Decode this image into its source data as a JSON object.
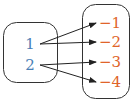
{
  "diagram": {
    "type": "mapping",
    "domain": {
      "values": [
        "1",
        "2"
      ],
      "color": "#4a7fb5"
    },
    "range": {
      "values": [
        "−1",
        "−2",
        "−3",
        "−4"
      ],
      "color": "#e0642a"
    },
    "mappings": [
      {
        "from": 0,
        "to": 0
      },
      {
        "from": 0,
        "to": 1
      },
      {
        "from": 1,
        "to": 2
      },
      {
        "from": 1,
        "to": 3
      }
    ],
    "arrow_color": "#222222",
    "box_color": "#333333"
  }
}
